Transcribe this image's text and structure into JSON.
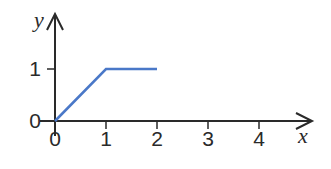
{
  "chart_data": {
    "type": "line",
    "title": "",
    "xlabel": "x",
    "ylabel": "y",
    "xlim": [
      0,
      4
    ],
    "ylim": [
      0,
      1
    ],
    "x_ticks": [
      "0",
      "1",
      "2",
      "3",
      "4"
    ],
    "y_ticks": [
      "0",
      "1"
    ],
    "grid": false,
    "legend": null,
    "series": [
      {
        "name": "piecewise",
        "color": "#4a78c8",
        "points": [
          [
            0,
            0
          ],
          [
            1,
            1
          ],
          [
            2,
            1
          ]
        ]
      }
    ]
  },
  "colors": {
    "axis": "#2a2a2a",
    "line": "#4a78c8",
    "background": "#ffffff"
  }
}
